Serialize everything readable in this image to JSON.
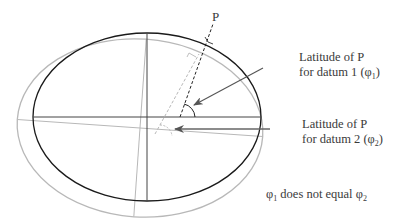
{
  "diagram": {
    "point_label": "P",
    "label_datum1_line1": "Latitude of P",
    "label_datum1_line2_prefix": "for datum 1 (",
    "label_datum1_phi": "φ",
    "label_datum1_sub": "1",
    "label_datum1_suffix": ")",
    "label_datum2_line1": "Latitude of P",
    "label_datum2_line2_prefix": "for datum 2 (",
    "label_datum2_phi": "φ",
    "label_datum2_sub": "2",
    "label_datum2_suffix": ")",
    "note_phi1": "φ",
    "note_sub1": "1",
    "note_middle": " does not equal ",
    "note_phi2": "φ",
    "note_sub2": "2",
    "colors": {
      "datum1": "#1a1a1a",
      "datum2": "#b5b5b5",
      "arrow": "#555555"
    }
  }
}
